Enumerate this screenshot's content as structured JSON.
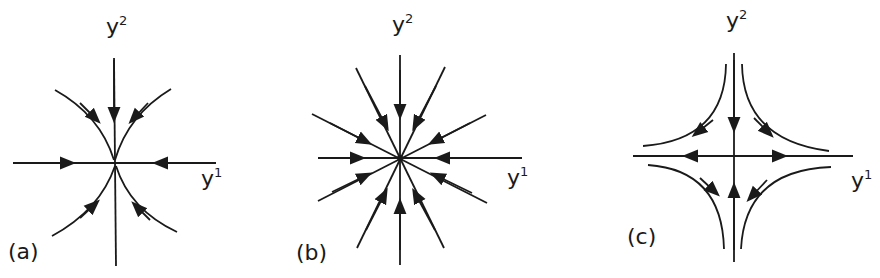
{
  "figure": {
    "panels": [
      {
        "id": "a",
        "caption": "(a)",
        "type": "improper node (stable, tangent to vertical axis)",
        "x_axis": "y",
        "x_sup": "1",
        "y_axis": "y",
        "y_sup": "2"
      },
      {
        "id": "b",
        "caption": "(b)",
        "type": "stable star node",
        "x_axis": "y",
        "x_sup": "1",
        "y_axis": "y",
        "y_sup": "2"
      },
      {
        "id": "c",
        "caption": "(c)",
        "type": "saddle point",
        "x_axis": "y",
        "x_sup": "1",
        "y_axis": "y",
        "y_sup": "2"
      }
    ],
    "colors": {
      "ink": "#1a1a1a",
      "background": "#ffffff"
    }
  }
}
